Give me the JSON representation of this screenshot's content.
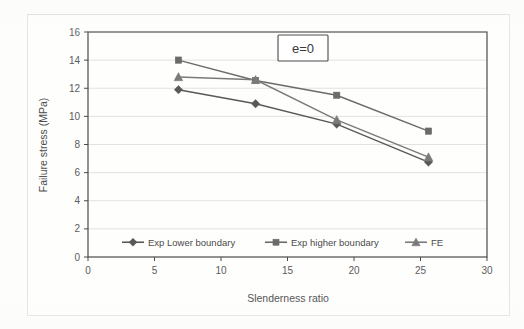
{
  "chart_data": {
    "type": "line",
    "title": "",
    "annotation": "e=0",
    "xlabel": "Slenderness ratio",
    "ylabel": "Failure stress (MPa)",
    "xlim": [
      0,
      30
    ],
    "ylim": [
      0,
      16
    ],
    "xticks": [
      0,
      5,
      10,
      15,
      20,
      25,
      30
    ],
    "yticks": [
      0,
      2,
      4,
      6,
      8,
      10,
      12,
      14,
      16
    ],
    "grid": "horizontal",
    "legend_position": "bottom-inside",
    "series": [
      {
        "name": "Exp Lower boundary",
        "marker": "diamond",
        "color": "#595959",
        "x": [
          6.8,
          12.6,
          18.7,
          25.6
        ],
        "values": [
          11.9,
          10.9,
          9.45,
          6.75
        ]
      },
      {
        "name": "Exp higher boundary",
        "marker": "square",
        "color": "#6b6b6b",
        "x": [
          6.8,
          12.6,
          18.7,
          25.6
        ],
        "values": [
          14.0,
          12.55,
          11.5,
          8.95
        ]
      },
      {
        "name": "FE",
        "marker": "triangle",
        "color": "#7a7a7a",
        "x": [
          6.8,
          12.6,
          18.7,
          25.6
        ],
        "values": [
          12.8,
          12.6,
          9.75,
          7.1
        ]
      }
    ]
  },
  "axes": {
    "x_tick_labels": [
      "0",
      "5",
      "10",
      "15",
      "20",
      "25",
      "30"
    ],
    "y_tick_labels": [
      "0",
      "2",
      "4",
      "6",
      "8",
      "10",
      "12",
      "14",
      "16"
    ],
    "x_title": "Slenderness ratio",
    "y_title": "Failure stress (MPa)"
  },
  "annotation": {
    "label": "e=0"
  },
  "legend": {
    "items": [
      {
        "label": "Exp Lower boundary",
        "marker": "diamond-marker"
      },
      {
        "label": "Exp higher boundary",
        "marker": "square-marker"
      },
      {
        "label": "FE",
        "marker": "triangle-marker"
      }
    ]
  },
  "colors": {
    "axis": "#4a4a4a",
    "grid": "#dadada",
    "plot_background": "#ffffff",
    "page_background": "#fdfdfc"
  }
}
